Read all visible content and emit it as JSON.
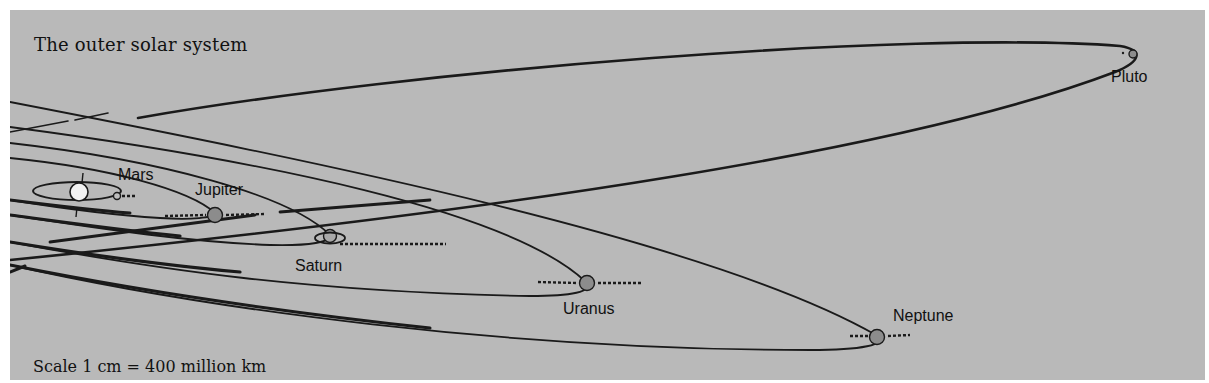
{
  "title": "The outer solar system",
  "scale_label": "Scale 1 cm = 400 million km",
  "colors": {
    "background": "#b9b9b9",
    "orbit_line": "#1a1a1a",
    "planet_fill": "#8c8c8c",
    "sun_fill": "#f2f2f2"
  },
  "bodies": [
    {
      "name": "Sun",
      "label": ""
    },
    {
      "name": "Mars",
      "label": "Mars"
    },
    {
      "name": "Jupiter",
      "label": "Jupiter"
    },
    {
      "name": "Saturn",
      "label": "Saturn"
    },
    {
      "name": "Uranus",
      "label": "Uranus"
    },
    {
      "name": "Neptune",
      "label": "Neptune"
    },
    {
      "name": "Pluto",
      "label": "Pluto"
    }
  ]
}
